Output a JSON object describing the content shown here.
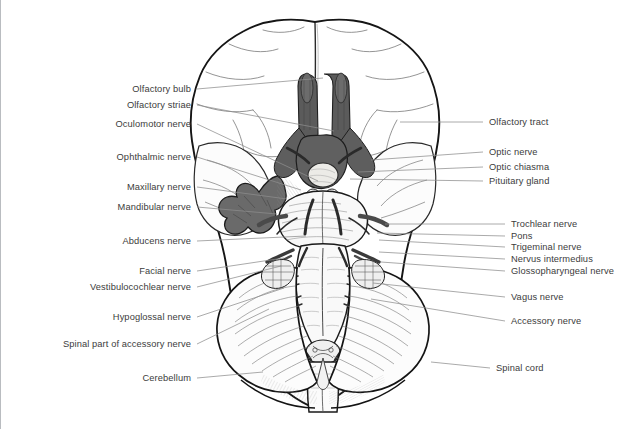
{
  "figure": {
    "background_color": "#ffffff",
    "ink_color": "#1a1a1a",
    "label_color": "#3c3c3c",
    "leader_color": "#8d8d8d",
    "shade_dark_color": "#5b5b5b",
    "shade_mid_color": "#8e8e8e",
    "shade_light_color": "#d2d2d2",
    "border_color": "#b9bcc0"
  },
  "labels_left": [
    {
      "id": "olfactory-bulb",
      "text": "Olfactory bulb",
      "x": 190,
      "y": 89,
      "leader_to_x": 322,
      "leader_to_y": 78
    },
    {
      "id": "olfactory-striae",
      "text": "Olfactory striae",
      "x": 190,
      "y": 105,
      "leader_to_x": 333,
      "leader_to_y": 131
    },
    {
      "id": "oculomotor-nerve",
      "text": "Oculomotor nerve",
      "x": 190,
      "y": 124,
      "leader_to_x": 317,
      "leader_to_y": 181
    },
    {
      "id": "ophthalmic-nerve",
      "text": "Ophthalmic nerve",
      "x": 190,
      "y": 157,
      "leader_to_x": 300,
      "leader_to_y": 190
    },
    {
      "id": "maxillary-nerve",
      "text": "Maxillary nerve",
      "x": 190,
      "y": 187,
      "leader_to_x": 286,
      "leader_to_y": 199
    },
    {
      "id": "mandibular-nerve",
      "text": "Mandibular nerve",
      "x": 190,
      "y": 207,
      "leader_to_x": 276,
      "leader_to_y": 214
    },
    {
      "id": "abducens-nerve",
      "text": "Abducens nerve",
      "x": 190,
      "y": 241,
      "leader_to_x": 305,
      "leader_to_y": 236
    },
    {
      "id": "facial-nerve",
      "text": "Facial nerve",
      "x": 190,
      "y": 271,
      "leader_to_x": 283,
      "leader_to_y": 258
    },
    {
      "id": "vestibulocochlear-nerve",
      "text": "Vestibulocochlear nerve",
      "x": 190,
      "y": 287,
      "leader_to_x": 280,
      "leader_to_y": 266
    },
    {
      "id": "hypoglossal-nerve",
      "text": "Hypoglossal nerve",
      "x": 190,
      "y": 317,
      "leader_to_x": 283,
      "leader_to_y": 288
    },
    {
      "id": "spinal-part-accessory",
      "text": "Spinal part of accessory nerve",
      "x": 190,
      "y": 344,
      "leader_to_x": 268,
      "leader_to_y": 309
    },
    {
      "id": "cerebellum",
      "text": "Cerebellum",
      "x": 190,
      "y": 378,
      "leader_to_x": 262,
      "leader_to_y": 372
    }
  ],
  "labels_right": [
    {
      "id": "olfactory-tract",
      "text": "Olfactory tract",
      "x": 488,
      "y": 122,
      "leader_to_x": 399,
      "leader_to_y": 122
    },
    {
      "id": "optic-nerve",
      "text": "Optic nerve",
      "x": 488,
      "y": 152,
      "leader_to_x": 370,
      "leader_to_y": 160
    },
    {
      "id": "optic-chiasma",
      "text": "Optic chiasma",
      "x": 488,
      "y": 167,
      "leader_to_x": 357,
      "leader_to_y": 172
    },
    {
      "id": "pituitary-gland",
      "text": "Pituitary gland",
      "x": 488,
      "y": 181,
      "leader_to_x": 349,
      "leader_to_y": 179
    },
    {
      "id": "trochlear-nerve",
      "text": "Trochlear nerve",
      "x": 510,
      "y": 224,
      "leader_to_x": 384,
      "leader_to_y": 224
    },
    {
      "id": "pons",
      "text": "Pons",
      "x": 510,
      "y": 236,
      "leader_to_x": 376,
      "leader_to_y": 233
    },
    {
      "id": "trigeminal-nerve",
      "text": "Trigeminal nerve",
      "x": 510,
      "y": 247,
      "leader_to_x": 378,
      "leader_to_y": 240
    },
    {
      "id": "nervus-intermedius",
      "text": "Nervus intermedius",
      "x": 510,
      "y": 259,
      "leader_to_x": 378,
      "leader_to_y": 252
    },
    {
      "id": "glossopharyngeal-nerve",
      "text": "Glossopharyngeal nerve",
      "x": 510,
      "y": 271,
      "leader_to_x": 380,
      "leader_to_y": 262
    },
    {
      "id": "vagus-nerve",
      "text": "Vagus nerve",
      "x": 510,
      "y": 297,
      "leader_to_x": 372,
      "leader_to_y": 283
    },
    {
      "id": "accessory-nerve",
      "text": "Accessory nerve",
      "x": 510,
      "y": 321,
      "leader_to_x": 370,
      "leader_to_y": 299
    },
    {
      "id": "spinal-cord",
      "text": "Spinal cord",
      "x": 495,
      "y": 368,
      "leader_to_x": 430,
      "leader_to_y": 362
    }
  ],
  "structures": [
    {
      "id": "frontal-lobe-left",
      "name": "Left frontal lobe"
    },
    {
      "id": "frontal-lobe-right",
      "name": "Right frontal lobe"
    },
    {
      "id": "temporal-lobe-left",
      "name": "Left temporal lobe"
    },
    {
      "id": "temporal-lobe-right",
      "name": "Right temporal lobe"
    },
    {
      "id": "occipital-lobe",
      "name": "Occipital lobe"
    },
    {
      "id": "olfactory-bulbs",
      "name": "Olfactory bulbs"
    },
    {
      "id": "olfactory-tracts",
      "name": "Olfactory tracts"
    },
    {
      "id": "optic-chiasm",
      "name": "Optic chiasm"
    },
    {
      "id": "pituitary",
      "name": "Pituitary gland"
    },
    {
      "id": "trigeminal-ganglion",
      "name": "Trigeminal ganglion"
    },
    {
      "id": "pons-body",
      "name": "Pons"
    },
    {
      "id": "medulla",
      "name": "Medulla oblongata"
    },
    {
      "id": "cerebellum-body",
      "name": "Cerebellum"
    },
    {
      "id": "spinal-cord-body",
      "name": "Spinal cord"
    }
  ]
}
